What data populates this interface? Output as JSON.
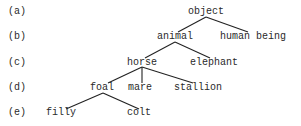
{
  "row_labels": [
    "(a)",
    "(b)",
    "(c)",
    "(d)",
    "(e)"
  ],
  "nodes": {
    "object": "object",
    "animal": "animal",
    "human_being": "human being",
    "horse": "horse",
    "elephant": "elephant",
    "foal": "foal",
    "mare": "mare",
    "stallion": "stallion",
    "filly": "filly",
    "colt": "colt"
  },
  "tree": {
    "object": [
      "animal",
      "human being"
    ],
    "animal": [
      "horse",
      "elephant"
    ],
    "horse": [
      "foal",
      "mare",
      "stallion"
    ],
    "foal": [
      "filly",
      "colt"
    ]
  }
}
